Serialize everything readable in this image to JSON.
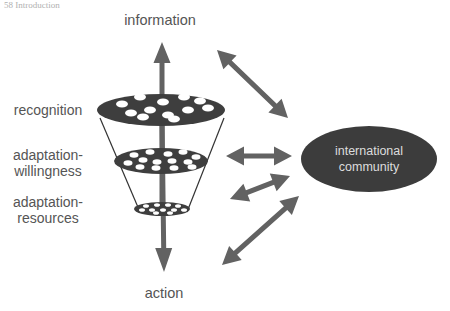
{
  "header": {
    "clipped_text": "58  Introduction"
  },
  "colors": {
    "arrow": "#626262",
    "disc": "#3e3e3e",
    "hole": "#ffffff",
    "funnel_line": "#333333",
    "label": "#555555",
    "community_fill": "#3c3c3c",
    "community_text": "#dddddd"
  },
  "labels": {
    "top": "information",
    "bottom": "action",
    "recognition": "recognition",
    "willingness_1": "adaptation-",
    "willingness_2": "willingness",
    "resources_1": "adaptation-",
    "resources_2": "resources"
  },
  "community": {
    "line1": "international",
    "line2": "community",
    "cx": 369,
    "cy": 159,
    "rx": 68,
    "ry": 33
  },
  "funnel": {
    "discs": [
      {
        "name": "recognition-disc",
        "cx": 161,
        "cy": 110,
        "rx": 64,
        "ry": 16,
        "hole_rx": 6,
        "hole_ry": 3.5,
        "holes": [
          [
            122,
            104
          ],
          [
            140,
            97
          ],
          [
            163,
            102
          ],
          [
            184,
            97
          ],
          [
            200,
            101
          ],
          [
            131,
            113
          ],
          [
            150,
            110
          ],
          [
            168,
            115
          ],
          [
            188,
            110
          ],
          [
            208,
            108
          ],
          [
            143,
            117
          ],
          [
            174,
            119
          ]
        ]
      },
      {
        "name": "willingness-disc",
        "cx": 161,
        "cy": 161,
        "rx": 47,
        "ry": 13,
        "hole_rx": 4.5,
        "hole_ry": 2.8,
        "holes": [
          [
            134,
            155
          ],
          [
            150,
            152
          ],
          [
            168,
            154
          ],
          [
            183,
            152
          ],
          [
            196,
            157
          ],
          [
            128,
            163
          ],
          [
            143,
            160
          ],
          [
            157,
            162
          ],
          [
            172,
            161
          ],
          [
            188,
            162
          ],
          [
            140,
            167
          ],
          [
            156,
            168
          ],
          [
            174,
            168
          ],
          [
            192,
            167
          ]
        ]
      },
      {
        "name": "resources-disc",
        "cx": 162,
        "cy": 209,
        "rx": 28,
        "ry": 7,
        "hole_rx": 3,
        "hole_ry": 1.8,
        "holes": [
          [
            146,
            206
          ],
          [
            157,
            205
          ],
          [
            168,
            205
          ],
          [
            178,
            206
          ],
          [
            142,
            210
          ],
          [
            152,
            210
          ],
          [
            163,
            210
          ],
          [
            174,
            210
          ],
          [
            184,
            210
          ],
          [
            156,
            213
          ],
          [
            170,
            213
          ]
        ]
      }
    ],
    "left_line": [
      100,
      118,
      140,
      212
    ],
    "right_line": [
      224,
      118,
      187,
      212
    ]
  },
  "arrows": {
    "vertical_up": {
      "x1": 162,
      "y1": 205,
      "x2": 162,
      "y2": 42
    },
    "vertical_down": {
      "x1": 162,
      "y1": 118,
      "x2": 164,
      "y2": 272
    },
    "links": [
      {
        "name": "info-community-arrow",
        "x1": 217,
        "y1": 50,
        "x2": 288,
        "y2": 118
      },
      {
        "name": "willingness-community-arrow",
        "x1": 226,
        "y1": 156,
        "x2": 292,
        "y2": 156
      },
      {
        "name": "resources-community-arrow",
        "x1": 230,
        "y1": 199,
        "x2": 290,
        "y2": 176
      },
      {
        "name": "action-community-arrow",
        "x1": 222,
        "y1": 265,
        "x2": 299,
        "y2": 196
      }
    ]
  }
}
